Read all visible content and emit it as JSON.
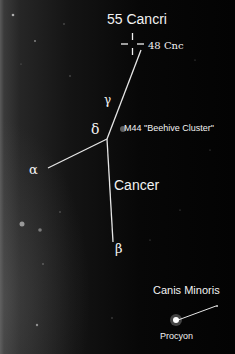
{
  "labels": {
    "target_star": "55 Cancri",
    "neighbor_star": "48 Cnc",
    "gamma": "γ",
    "delta": "δ",
    "alpha": "α",
    "beta": "β",
    "cluster": "M44 \"Beehive Cluster\"",
    "constellation": "Cancer",
    "neighbor_constellation": "Canis Minoris",
    "bright_star": "Procyon"
  },
  "colors": {
    "background": "#030303",
    "line": "#e6e6e6",
    "text": "#f2f2f2"
  }
}
